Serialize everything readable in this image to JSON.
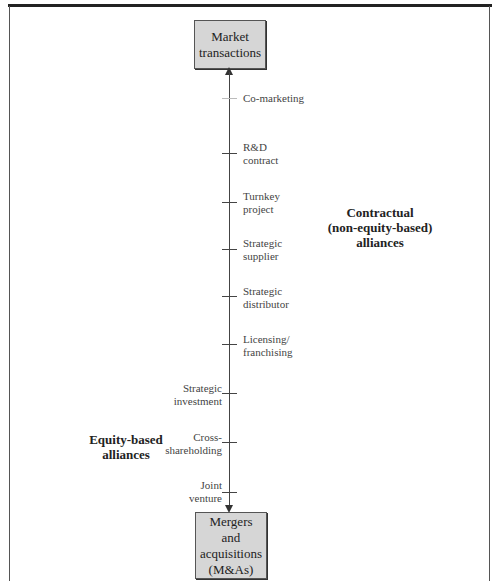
{
  "diagram": {
    "top_box": {
      "lines": [
        "Market",
        "transactions"
      ]
    },
    "bottom_box": {
      "lines": [
        "Mergers",
        "and",
        "acquisitions",
        "(M&As)"
      ]
    },
    "contractual_group": {
      "lines": [
        "Contractual",
        "(non-equity-based)",
        "alliances"
      ]
    },
    "equity_group": {
      "lines": [
        "Equity-based",
        "alliances"
      ]
    },
    "items": [
      {
        "id": "co-marketing",
        "lines": [
          "Co-marketing"
        ],
        "side": "right",
        "tick_y": 98
      },
      {
        "id": "rd-contract",
        "lines": [
          "R&D",
          "contract"
        ],
        "side": "right",
        "tick_y": 153
      },
      {
        "id": "turnkey-project",
        "lines": [
          "Turnkey",
          "project"
        ],
        "side": "right",
        "tick_y": 202
      },
      {
        "id": "strategic-supplier",
        "lines": [
          "Strategic",
          "supplier"
        ],
        "side": "right",
        "tick_y": 249
      },
      {
        "id": "strategic-distributor",
        "lines": [
          "Strategic",
          "distributor"
        ],
        "side": "right",
        "tick_y": 296
      },
      {
        "id": "licensing-franchising",
        "lines": [
          "Licensing/",
          "franchising"
        ],
        "side": "right",
        "tick_y": 344
      },
      {
        "id": "strategic-investment",
        "lines": [
          "Strategic",
          "investment"
        ],
        "side": "left",
        "tick_y": 393
      },
      {
        "id": "cross-shareholding",
        "lines": [
          "Cross-",
          "shareholding"
        ],
        "side": "left",
        "tick_y": 442
      },
      {
        "id": "joint-venture",
        "lines": [
          "Joint",
          "venture"
        ],
        "side": "left",
        "tick_y": 492
      }
    ]
  }
}
